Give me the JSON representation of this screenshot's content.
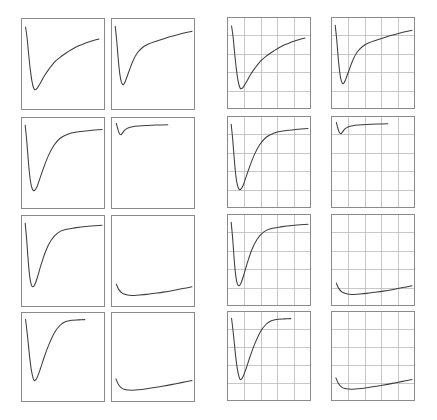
{
  "figure": {
    "title": "",
    "width": 437,
    "height": 420,
    "background_color": "#ffffff",
    "rows": 4,
    "columns": 4,
    "panel_count": 16,
    "frame_color": "#8a8a8a",
    "grid_color": "#b9b9b9",
    "curve_color": "#3d3d3d"
  },
  "chart_data": {
    "type": "line",
    "title": "",
    "subtitle": "",
    "xlabel": "",
    "ylabel": "",
    "grid": "right two columns only",
    "legend": "none",
    "layout": {
      "rows": 4,
      "cols": 4,
      "grid_cells_x": 5,
      "grid_cells_y": 5,
      "xlim": [
        0,
        1
      ],
      "ylim": [
        0,
        1
      ]
    },
    "panels": [
      {
        "id": "panel-r1c1",
        "row": 1,
        "col": 1,
        "grid": false,
        "x_px": 21,
        "y_px": 18,
        "w_px": 84,
        "h_px": 92,
        "curve_start_y": 0.07,
        "curve_min_x": 0.14,
        "curve_min_y": 0.8,
        "curve_end_x": 0.96,
        "curve_end_y": 0.21,
        "x": [
          0.02,
          0.04,
          0.06,
          0.08,
          0.1,
          0.12,
          0.14,
          0.17,
          0.21,
          0.26,
          0.32,
          0.4,
          0.48,
          0.56,
          0.65,
          0.74,
          0.83,
          0.96
        ],
        "y": [
          0.07,
          0.2,
          0.39,
          0.56,
          0.69,
          0.77,
          0.8,
          0.78,
          0.72,
          0.64,
          0.56,
          0.47,
          0.41,
          0.36,
          0.31,
          0.275,
          0.245,
          0.21
        ]
      },
      {
        "id": "panel-r1c2",
        "row": 1,
        "col": 2,
        "grid": false,
        "x_px": 111,
        "y_px": 18,
        "w_px": 84,
        "h_px": 92,
        "curve_start_y": 0.06,
        "curve_min_x": 0.12,
        "curve_min_y": 0.74,
        "curve_end_x": 1.0,
        "curve_end_y": 0.12,
        "x": [
          0.015,
          0.035,
          0.055,
          0.075,
          0.095,
          0.12,
          0.15,
          0.19,
          0.24,
          0.3,
          0.37,
          0.45,
          0.54,
          0.64,
          0.75,
          0.87,
          1.0
        ],
        "y": [
          0.06,
          0.23,
          0.45,
          0.62,
          0.71,
          0.74,
          0.69,
          0.59,
          0.47,
          0.37,
          0.305,
          0.265,
          0.235,
          0.205,
          0.175,
          0.145,
          0.12
        ]
      },
      {
        "id": "panel-r1c3",
        "row": 1,
        "col": 3,
        "grid": true,
        "x_px": 227,
        "y_px": 17,
        "w_px": 84,
        "h_px": 92,
        "curve_start_y": 0.07,
        "curve_min_x": 0.14,
        "curve_min_y": 0.8,
        "curve_end_x": 0.96,
        "curve_end_y": 0.21,
        "x": [
          0.02,
          0.04,
          0.06,
          0.08,
          0.1,
          0.12,
          0.14,
          0.17,
          0.21,
          0.26,
          0.32,
          0.4,
          0.48,
          0.56,
          0.65,
          0.74,
          0.83,
          0.96
        ],
        "y": [
          0.07,
          0.2,
          0.39,
          0.56,
          0.69,
          0.77,
          0.8,
          0.78,
          0.72,
          0.64,
          0.56,
          0.47,
          0.41,
          0.36,
          0.31,
          0.275,
          0.245,
          0.21
        ]
      },
      {
        "id": "panel-r1c4",
        "row": 1,
        "col": 4,
        "grid": true,
        "x_px": 331,
        "y_px": 17,
        "w_px": 84,
        "h_px": 92,
        "curve_start_y": 0.06,
        "curve_min_x": 0.12,
        "curve_min_y": 0.74,
        "curve_end_x": 1.0,
        "curve_end_y": 0.12,
        "x": [
          0.015,
          0.035,
          0.055,
          0.075,
          0.095,
          0.12,
          0.15,
          0.19,
          0.24,
          0.3,
          0.37,
          0.45,
          0.54,
          0.64,
          0.75,
          0.87,
          1.0
        ],
        "y": [
          0.06,
          0.23,
          0.45,
          0.62,
          0.71,
          0.74,
          0.69,
          0.59,
          0.47,
          0.37,
          0.305,
          0.265,
          0.235,
          0.205,
          0.175,
          0.145,
          0.12
        ]
      },
      {
        "id": "panel-r2c1",
        "row": 2,
        "col": 1,
        "grid": false,
        "x_px": 21,
        "y_px": 117,
        "w_px": 84,
        "h_px": 92,
        "curve_start_y": 0.06,
        "curve_min_x": 0.13,
        "curve_min_y": 0.82,
        "curve_end_x": 1.0,
        "curve_end_y": 0.11,
        "x": [
          0.015,
          0.035,
          0.055,
          0.075,
          0.095,
          0.115,
          0.135,
          0.165,
          0.2,
          0.25,
          0.31,
          0.38,
          0.46,
          0.56,
          0.68,
          0.82,
          1.0
        ],
        "y": [
          0.06,
          0.24,
          0.47,
          0.66,
          0.77,
          0.815,
          0.82,
          0.78,
          0.69,
          0.56,
          0.42,
          0.3,
          0.215,
          0.165,
          0.14,
          0.125,
          0.11
        ]
      },
      {
        "id": "panel-r2c2",
        "row": 2,
        "col": 2,
        "grid": false,
        "x_px": 111,
        "y_px": 117,
        "w_px": 84,
        "h_px": 92,
        "curve_start_y": 0.04,
        "curve_min_x": 0.09,
        "curve_min_y": 0.17,
        "curve_end_x": 0.69,
        "curve_end_y": 0.055,
        "x": [
          0.03,
          0.05,
          0.07,
          0.09,
          0.11,
          0.14,
          0.18,
          0.24,
          0.32,
          0.42,
          0.54,
          0.69
        ],
        "y": [
          0.04,
          0.11,
          0.16,
          0.17,
          0.15,
          0.115,
          0.092,
          0.078,
          0.07,
          0.064,
          0.059,
          0.055
        ]
      },
      {
        "id": "panel-r2c3",
        "row": 2,
        "col": 3,
        "grid": true,
        "x_px": 227,
        "y_px": 116,
        "w_px": 84,
        "h_px": 92,
        "curve_start_y": 0.06,
        "curve_min_x": 0.13,
        "curve_min_y": 0.82,
        "curve_end_x": 1.0,
        "curve_end_y": 0.11,
        "x": [
          0.015,
          0.035,
          0.055,
          0.075,
          0.095,
          0.115,
          0.135,
          0.165,
          0.2,
          0.25,
          0.31,
          0.38,
          0.46,
          0.56,
          0.68,
          0.82,
          1.0
        ],
        "y": [
          0.06,
          0.24,
          0.47,
          0.66,
          0.77,
          0.815,
          0.82,
          0.78,
          0.69,
          0.56,
          0.42,
          0.3,
          0.215,
          0.165,
          0.14,
          0.125,
          0.11
        ]
      },
      {
        "id": "panel-r2c4",
        "row": 2,
        "col": 4,
        "grid": true,
        "x_px": 331,
        "y_px": 116,
        "w_px": 84,
        "h_px": 92,
        "curve_start_y": 0.04,
        "curve_min_x": 0.09,
        "curve_min_y": 0.17,
        "curve_end_x": 0.69,
        "curve_end_y": 0.055,
        "x": [
          0.03,
          0.05,
          0.07,
          0.09,
          0.11,
          0.14,
          0.18,
          0.24,
          0.32,
          0.42,
          0.54,
          0.69
        ],
        "y": [
          0.04,
          0.11,
          0.16,
          0.17,
          0.15,
          0.115,
          0.092,
          0.078,
          0.07,
          0.064,
          0.059,
          0.055
        ]
      },
      {
        "id": "panel-r3c1",
        "row": 3,
        "col": 1,
        "grid": false,
        "x_px": 21,
        "y_px": 215,
        "w_px": 84,
        "h_px": 92,
        "curve_start_y": 0.06,
        "curve_min_x": 0.12,
        "curve_min_y": 0.8,
        "curve_end_x": 1.0,
        "curve_end_y": 0.085,
        "x": [
          0.015,
          0.035,
          0.055,
          0.075,
          0.095,
          0.115,
          0.14,
          0.175,
          0.22,
          0.28,
          0.35,
          0.43,
          0.53,
          0.65,
          0.8,
          1.0
        ],
        "y": [
          0.06,
          0.26,
          0.51,
          0.69,
          0.78,
          0.8,
          0.77,
          0.68,
          0.54,
          0.38,
          0.255,
          0.175,
          0.135,
          0.115,
          0.098,
          0.085
        ]
      },
      {
        "id": "panel-r3c2",
        "row": 3,
        "col": 2,
        "grid": false,
        "x_px": 111,
        "y_px": 215,
        "w_px": 84,
        "h_px": 92,
        "curve_start_y": 0.77,
        "curve_min_x": 0.26,
        "curve_min_y": 0.9,
        "curve_end_x": 1.0,
        "curve_end_y": 0.8,
        "x": [
          0.03,
          0.06,
          0.1,
          0.15,
          0.2,
          0.26,
          0.33,
          0.42,
          0.52,
          0.63,
          0.76,
          0.9,
          1.0
        ],
        "y": [
          0.77,
          0.83,
          0.87,
          0.89,
          0.898,
          0.9,
          0.896,
          0.888,
          0.876,
          0.862,
          0.842,
          0.818,
          0.8
        ]
      },
      {
        "id": "panel-r3c3",
        "row": 3,
        "col": 3,
        "grid": true,
        "x_px": 227,
        "y_px": 214,
        "w_px": 84,
        "h_px": 92,
        "curve_start_y": 0.06,
        "curve_min_x": 0.12,
        "curve_min_y": 0.8,
        "curve_end_x": 1.0,
        "curve_end_y": 0.085,
        "x": [
          0.015,
          0.035,
          0.055,
          0.075,
          0.095,
          0.115,
          0.14,
          0.175,
          0.22,
          0.28,
          0.35,
          0.43,
          0.53,
          0.65,
          0.8,
          1.0
        ],
        "y": [
          0.06,
          0.26,
          0.51,
          0.69,
          0.78,
          0.8,
          0.77,
          0.68,
          0.54,
          0.38,
          0.255,
          0.175,
          0.135,
          0.115,
          0.098,
          0.085
        ]
      },
      {
        "id": "panel-r3c4",
        "row": 3,
        "col": 4,
        "grid": true,
        "x_px": 331,
        "y_px": 214,
        "w_px": 84,
        "h_px": 92,
        "curve_start_y": 0.77,
        "curve_min_x": 0.26,
        "curve_min_y": 0.9,
        "curve_end_x": 1.0,
        "curve_end_y": 0.8,
        "x": [
          0.03,
          0.06,
          0.1,
          0.15,
          0.2,
          0.26,
          0.33,
          0.42,
          0.52,
          0.63,
          0.76,
          0.9,
          1.0
        ],
        "y": [
          0.77,
          0.83,
          0.87,
          0.89,
          0.898,
          0.9,
          0.896,
          0.888,
          0.876,
          0.862,
          0.842,
          0.818,
          0.8
        ]
      },
      {
        "id": "panel-r4c1",
        "row": 4,
        "col": 1,
        "grid": false,
        "x_px": 21,
        "y_px": 312,
        "w_px": 84,
        "h_px": 90,
        "curve_start_y": 0.05,
        "curve_min_x": 0.14,
        "curve_min_y": 0.78,
        "curve_end_x": 0.78,
        "curve_end_y": 0.055,
        "x": [
          0.02,
          0.045,
          0.07,
          0.095,
          0.12,
          0.14,
          0.17,
          0.21,
          0.26,
          0.32,
          0.39,
          0.46,
          0.53,
          0.62,
          0.7,
          0.78
        ],
        "y": [
          0.05,
          0.25,
          0.48,
          0.66,
          0.76,
          0.78,
          0.74,
          0.64,
          0.5,
          0.35,
          0.21,
          0.125,
          0.08,
          0.062,
          0.058,
          0.055
        ]
      },
      {
        "id": "panel-r4c2",
        "row": 4,
        "col": 2,
        "grid": false,
        "x_px": 111,
        "y_px": 312,
        "w_px": 84,
        "h_px": 90,
        "curve_start_y": 0.76,
        "curve_min_x": 0.24,
        "curve_min_y": 0.895,
        "curve_end_x": 1.0,
        "curve_end_y": 0.78,
        "x": [
          0.025,
          0.055,
          0.095,
          0.14,
          0.19,
          0.24,
          0.31,
          0.4,
          0.5,
          0.62,
          0.75,
          0.88,
          1.0
        ],
        "y": [
          0.76,
          0.825,
          0.868,
          0.888,
          0.894,
          0.895,
          0.89,
          0.88,
          0.866,
          0.848,
          0.826,
          0.802,
          0.78
        ]
      },
      {
        "id": "panel-r4c3",
        "row": 4,
        "col": 3,
        "grid": true,
        "x_px": 227,
        "y_px": 311,
        "w_px": 84,
        "h_px": 90,
        "curve_start_y": 0.05,
        "curve_min_x": 0.14,
        "curve_min_y": 0.78,
        "curve_end_x": 0.78,
        "curve_end_y": 0.055,
        "x": [
          0.02,
          0.045,
          0.07,
          0.095,
          0.12,
          0.14,
          0.17,
          0.21,
          0.26,
          0.32,
          0.39,
          0.46,
          0.53,
          0.62,
          0.7,
          0.78
        ],
        "y": [
          0.05,
          0.25,
          0.48,
          0.66,
          0.76,
          0.78,
          0.74,
          0.64,
          0.5,
          0.35,
          0.21,
          0.125,
          0.08,
          0.062,
          0.058,
          0.055
        ]
      },
      {
        "id": "panel-r4c4",
        "row": 4,
        "col": 4,
        "grid": true,
        "x_px": 331,
        "y_px": 311,
        "w_px": 84,
        "h_px": 90,
        "curve_start_y": 0.76,
        "curve_min_x": 0.24,
        "curve_min_y": 0.895,
        "curve_end_x": 1.0,
        "curve_end_y": 0.78,
        "x": [
          0.025,
          0.055,
          0.095,
          0.14,
          0.19,
          0.24,
          0.31,
          0.4,
          0.5,
          0.62,
          0.75,
          0.88,
          1.0
        ],
        "y": [
          0.76,
          0.825,
          0.868,
          0.888,
          0.894,
          0.895,
          0.89,
          0.88,
          0.866,
          0.848,
          0.826,
          0.802,
          0.78
        ]
      }
    ]
  }
}
